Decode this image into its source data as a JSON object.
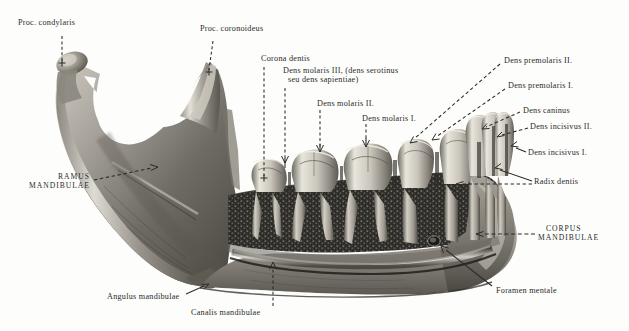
{
  "figure": {
    "background_color": "#fdfdfc",
    "ink_color": "#2a2a28",
    "bone_light": "#d8d4cb",
    "bone_mid": "#8d8a82",
    "bone_dark": "#3a3833",
    "tooth_light": "#efece4",
    "tooth_shadow": "#6e6b63",
    "marrow_dark": "#242320"
  },
  "labels": [
    {
      "id": "proc-condylaris",
      "text": "Proc. condylaris",
      "x": 18,
      "y": 22,
      "style": "normal",
      "align": "left"
    },
    {
      "id": "proc-coronoideus",
      "text": "Proc. coronoideus",
      "x": 200,
      "y": 28,
      "style": "normal",
      "align": "left"
    },
    {
      "id": "corona-dentis",
      "text": "Corona dentis",
      "x": 262,
      "y": 58,
      "style": "normal",
      "align": "left"
    },
    {
      "id": "dens-molaris-3-l1",
      "text": "Dens molaris III, (dens serotinus",
      "x": 283,
      "y": 71,
      "style": "normal",
      "align": "left"
    },
    {
      "id": "dens-molaris-3-l2",
      "text": "seu dens sapientiae)",
      "x": 289,
      "y": 80,
      "style": "normal",
      "align": "left"
    },
    {
      "id": "dens-molaris-2",
      "text": "Dens molaris II.",
      "x": 317,
      "y": 103,
      "style": "normal",
      "align": "left"
    },
    {
      "id": "dens-molaris-1",
      "text": "Dens molaris I.",
      "x": 363,
      "y": 118,
      "style": "normal",
      "align": "left"
    },
    {
      "id": "dens-premolaris-2",
      "text": "Dens premolaris II.",
      "x": 505,
      "y": 60,
      "style": "normal",
      "align": "left"
    },
    {
      "id": "dens-premolaris-1",
      "text": "Dens premolaris I.",
      "x": 509,
      "y": 85,
      "style": "normal",
      "align": "left"
    },
    {
      "id": "dens-caninus",
      "text": "Dens caninus",
      "x": 524,
      "y": 110,
      "style": "normal",
      "align": "left"
    },
    {
      "id": "dens-incisivus-2",
      "text": "Dens incisivus II.",
      "x": 531,
      "y": 126,
      "style": "normal",
      "align": "left"
    },
    {
      "id": "dens-incisivus-1",
      "text": "Dens incisivus I.",
      "x": 529,
      "y": 152,
      "style": "normal",
      "align": "left"
    },
    {
      "id": "radix-dentis",
      "text": "Radix dentis",
      "x": 535,
      "y": 181,
      "style": "normal",
      "align": "left"
    },
    {
      "id": "ramus-mandibulae-l1",
      "text": "RAMUS",
      "x": 58,
      "y": 176,
      "style": "caps",
      "align": "right"
    },
    {
      "id": "ramus-mandibulae-l2",
      "text": "MANDIBULAE",
      "x": 22,
      "y": 185,
      "style": "caps",
      "align": "right"
    },
    {
      "id": "corpus-mandibulae-l1",
      "text": "CORPUS",
      "x": 546,
      "y": 228,
      "style": "caps",
      "align": "left"
    },
    {
      "id": "corpus-mandibulae-l2",
      "text": "MANDIBULAE",
      "x": 538,
      "y": 238,
      "style": "caps",
      "align": "left"
    },
    {
      "id": "angulus-mandibulae",
      "text": "Angulus mandibulae",
      "x": 108,
      "y": 296,
      "style": "normal",
      "align": "left"
    },
    {
      "id": "canalis-mandibulae",
      "text": "Canalis mandibulae",
      "x": 192,
      "y": 312,
      "style": "normal",
      "align": "left"
    },
    {
      "id": "foramen-mentale",
      "text": "Foramen mentale",
      "x": 497,
      "y": 290,
      "style": "normal",
      "align": "left"
    }
  ],
  "leaders": [
    {
      "id": "leader-proc-condylaris",
      "dashed": true,
      "arrow": "cross",
      "points": "62,36 62,64"
    },
    {
      "id": "leader-proc-coronoideus",
      "dashed": true,
      "arrow": "cross",
      "points": "212,41 209,72"
    },
    {
      "id": "leader-corona-dentis",
      "dashed": true,
      "arrow": "cross",
      "points": "264,68 264,178"
    },
    {
      "id": "leader-dens-molaris-3",
      "dashed": true,
      "arrow": "down",
      "points": "285,88 285,168"
    },
    {
      "id": "leader-dens-molaris-2",
      "dashed": true,
      "arrow": "down",
      "points": "320,110 320,152"
    },
    {
      "id": "leader-dens-molaris-1",
      "dashed": true,
      "arrow": "down",
      "points": "366,124 366,147"
    },
    {
      "id": "leader-dens-premolaris-2",
      "dashed": true,
      "arrow": "down",
      "points": "502,64 410,142"
    },
    {
      "id": "leader-dens-premolaris-1",
      "dashed": true,
      "arrow": "down",
      "points": "506,89 430,140"
    },
    {
      "id": "leader-dens-caninus",
      "dashed": true,
      "arrow": "left",
      "points": "521,112 462,134"
    },
    {
      "id": "leader-dens-incisivus-2",
      "dashed": true,
      "arrow": "left",
      "points": "528,128 478,140"
    },
    {
      "id": "leader-dens-incisivus-1",
      "dashed": false,
      "arrow": "left",
      "points": "526,152 486,148"
    },
    {
      "id": "leader-radix-dentis-a",
      "dashed": false,
      "arrow": "left",
      "points": "531,181 480,163"
    },
    {
      "id": "leader-radix-dentis-b",
      "dashed": true,
      "arrow": "left",
      "points": "531,184 452,182"
    },
    {
      "id": "leader-ramus",
      "dashed": true,
      "arrow": "right",
      "points": "92,180 160,166"
    },
    {
      "id": "leader-corpus",
      "dashed": true,
      "arrow": "left",
      "points": "536,234 470,233"
    },
    {
      "id": "leader-angulus",
      "dashed": false,
      "arrow": "right",
      "points": "188,295 206,283"
    },
    {
      "id": "leader-canalis",
      "dashed": true,
      "arrow": "up",
      "points": "273,307 273,262"
    },
    {
      "id": "leader-foramen",
      "dashed": false,
      "arrow": "up",
      "points": "492,287 435,243"
    }
  ]
}
